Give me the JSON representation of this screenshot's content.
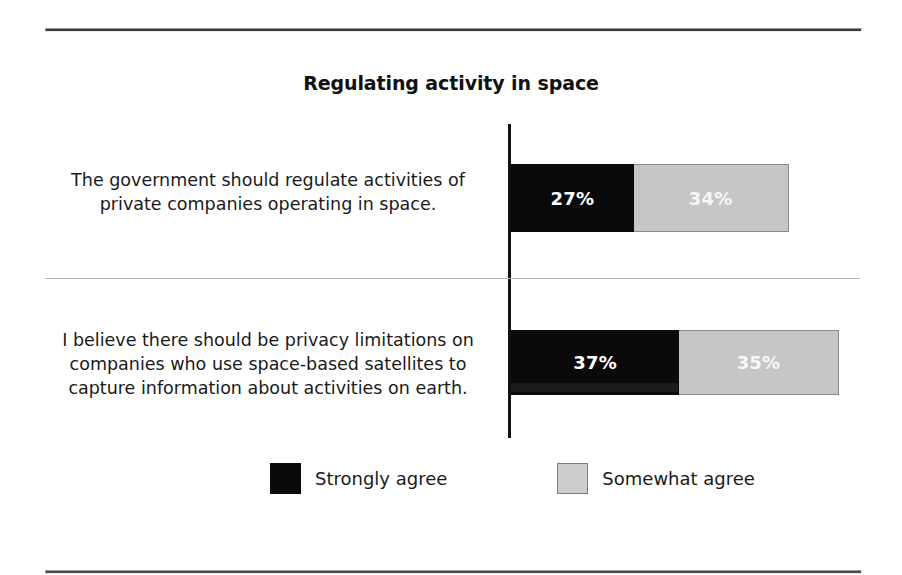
{
  "chart_data": {
    "type": "bar",
    "orientation": "horizontal",
    "stacked": true,
    "title": "Regulating activity in space",
    "xlabel": "",
    "ylabel": "",
    "grid": false,
    "legend_position": "bottom",
    "categories": [
      "The government should regulate activities of private companies operating in space.",
      "I believe there should be privacy limitations on companies who use space-based satellites to capture information about activities on earth."
    ],
    "series": [
      {
        "name": "Strongly agree",
        "color": "#0a0a0a",
        "values": [
          27,
          37
        ],
        "value_labels": [
          "27%",
          "35%"
        ]
      },
      {
        "name": "Somewhat agree",
        "color": "#c6c6c6",
        "values": [
          34,
          35
        ],
        "value_labels": [
          "34%",
          "35%"
        ]
      }
    ],
    "annotations": []
  },
  "title": "Regulating activity in space",
  "rows": [
    {
      "label_lines": [
        "The government should regulate activities of",
        "private companies operating in space."
      ],
      "label_text": "The government should regulate activities of private companies operating in space.",
      "strongly_agree": 27,
      "strongly_agree_label": "27%",
      "somewhat_agree": 34,
      "somewhat_agree_label": "34%"
    },
    {
      "label_lines": [
        "I believe there should be privacy limitations on",
        "companies who use space-based satellites to",
        "capture information about activities on earth."
      ],
      "label_text": "I believe there should be privacy limitations on companies who use space-based satellites to capture information about activities on earth.",
      "strongly_agree": 37,
      "strongly_agree_label": "37%",
      "somewhat_agree": 35,
      "somewhat_agree_label": "35%"
    }
  ],
  "legend": {
    "items": [
      {
        "label": "Strongly agree",
        "color": "#0a0a0a"
      },
      {
        "label": "Somewhat agree",
        "color": "#c6c6c6"
      }
    ]
  },
  "colors": {
    "strongly_agree": "#0a0a0a",
    "somewhat_agree": "#c6c6c6",
    "axis": "#111111",
    "rule": "#3a3a3a",
    "separator": "#b9b9b9",
    "text": "#1a1a1a",
    "value_label": "#ffffff",
    "background": "#ffffff"
  },
  "scale": {
    "px_per_percent": 4.55,
    "axis_x": 511
  }
}
